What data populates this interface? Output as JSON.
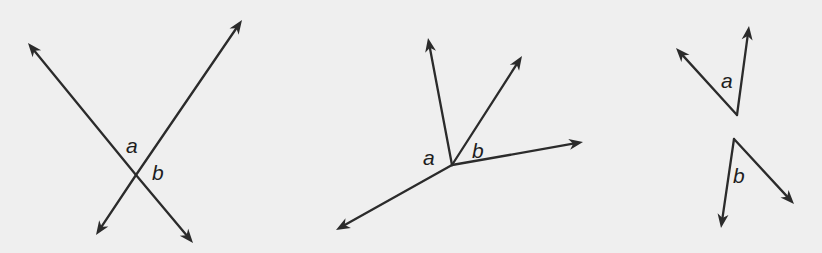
{
  "colors": {
    "background": "#efefef",
    "ink": "#2b2b2b"
  },
  "figures": [
    {
      "id": "intersecting-lines",
      "description": "Two intersecting lines forming vertical angles",
      "labels": [
        "a",
        "b"
      ]
    },
    {
      "id": "rays-from-point",
      "description": "Four rays from a common endpoint; angles a and b adjacent",
      "labels": [
        "a",
        "b"
      ]
    },
    {
      "id": "separate-angles",
      "description": "Two separate angles a and b with distinct vertices",
      "labels": [
        "a",
        "b"
      ]
    }
  ]
}
